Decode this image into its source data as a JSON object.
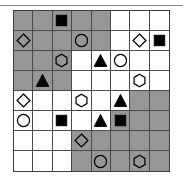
{
  "diagram": {
    "type": "8x8-shape-grid",
    "rows": 8,
    "columns": 8,
    "colors": {
      "shaded_cell": "#969696",
      "empty_cell": "#ffffff",
      "grid_line": "#4a4a4a",
      "border": "#3d3d3d",
      "shape_fill_solid": "#000000",
      "shape_stroke": "#000000",
      "top_rule": "#8f8f8f"
    },
    "legend": {
      "shapes": [
        "square",
        "circle",
        "diamond",
        "hexagon",
        "triangle"
      ],
      "fills": [
        "solid",
        "outline"
      ],
      "backgrounds": [
        "gray",
        "white"
      ]
    },
    "cells": [
      [
        {
          "bg": "gray",
          "shape": "none",
          "fill": "none"
        },
        {
          "bg": "gray",
          "shape": "none",
          "fill": "none"
        },
        {
          "bg": "gray",
          "shape": "square",
          "fill": "solid"
        },
        {
          "bg": "gray",
          "shape": "none",
          "fill": "none"
        },
        {
          "bg": "gray",
          "shape": "none",
          "fill": "none"
        },
        {
          "bg": "white",
          "shape": "none",
          "fill": "none"
        },
        {
          "bg": "white",
          "shape": "none",
          "fill": "none"
        },
        {
          "bg": "white",
          "shape": "none",
          "fill": "none"
        }
      ],
      [
        {
          "bg": "gray",
          "shape": "diamond",
          "fill": "outline"
        },
        {
          "bg": "gray",
          "shape": "none",
          "fill": "none"
        },
        {
          "bg": "gray",
          "shape": "none",
          "fill": "none"
        },
        {
          "bg": "gray",
          "shape": "circle",
          "fill": "outline"
        },
        {
          "bg": "gray",
          "shape": "none",
          "fill": "none"
        },
        {
          "bg": "white",
          "shape": "none",
          "fill": "none"
        },
        {
          "bg": "white",
          "shape": "diamond",
          "fill": "outline"
        },
        {
          "bg": "white",
          "shape": "square",
          "fill": "solid"
        }
      ],
      [
        {
          "bg": "gray",
          "shape": "none",
          "fill": "none"
        },
        {
          "bg": "gray",
          "shape": "none",
          "fill": "none"
        },
        {
          "bg": "gray",
          "shape": "hexagon",
          "fill": "outline"
        },
        {
          "bg": "white",
          "shape": "none",
          "fill": "none"
        },
        {
          "bg": "white",
          "shape": "triangle",
          "fill": "solid"
        },
        {
          "bg": "white",
          "shape": "circle",
          "fill": "outline"
        },
        {
          "bg": "white",
          "shape": "none",
          "fill": "none"
        },
        {
          "bg": "white",
          "shape": "none",
          "fill": "none"
        }
      ],
      [
        {
          "bg": "gray",
          "shape": "none",
          "fill": "none"
        },
        {
          "bg": "gray",
          "shape": "triangle",
          "fill": "solid"
        },
        {
          "bg": "gray",
          "shape": "none",
          "fill": "none"
        },
        {
          "bg": "white",
          "shape": "none",
          "fill": "none"
        },
        {
          "bg": "white",
          "shape": "none",
          "fill": "none"
        },
        {
          "bg": "white",
          "shape": "none",
          "fill": "none"
        },
        {
          "bg": "white",
          "shape": "hexagon",
          "fill": "outline"
        },
        {
          "bg": "white",
          "shape": "none",
          "fill": "none"
        }
      ],
      [
        {
          "bg": "white",
          "shape": "diamond",
          "fill": "outline"
        },
        {
          "bg": "white",
          "shape": "none",
          "fill": "none"
        },
        {
          "bg": "white",
          "shape": "none",
          "fill": "none"
        },
        {
          "bg": "white",
          "shape": "hexagon",
          "fill": "outline"
        },
        {
          "bg": "white",
          "shape": "none",
          "fill": "none"
        },
        {
          "bg": "white",
          "shape": "triangle",
          "fill": "solid"
        },
        {
          "bg": "gray",
          "shape": "none",
          "fill": "none"
        },
        {
          "bg": "gray",
          "shape": "none",
          "fill": "none"
        }
      ],
      [
        {
          "bg": "white",
          "shape": "circle",
          "fill": "outline"
        },
        {
          "bg": "white",
          "shape": "none",
          "fill": "none"
        },
        {
          "bg": "white",
          "shape": "square",
          "fill": "solid"
        },
        {
          "bg": "white",
          "shape": "none",
          "fill": "none"
        },
        {
          "bg": "white",
          "shape": "triangle",
          "fill": "solid"
        },
        {
          "bg": "gray",
          "shape": "square",
          "fill": "solid"
        },
        {
          "bg": "gray",
          "shape": "none",
          "fill": "none"
        },
        {
          "bg": "gray",
          "shape": "none",
          "fill": "none"
        }
      ],
      [
        {
          "bg": "white",
          "shape": "none",
          "fill": "none"
        },
        {
          "bg": "white",
          "shape": "none",
          "fill": "none"
        },
        {
          "bg": "white",
          "shape": "none",
          "fill": "none"
        },
        {
          "bg": "gray",
          "shape": "diamond",
          "fill": "outline"
        },
        {
          "bg": "gray",
          "shape": "none",
          "fill": "none"
        },
        {
          "bg": "gray",
          "shape": "none",
          "fill": "none"
        },
        {
          "bg": "gray",
          "shape": "none",
          "fill": "none"
        },
        {
          "bg": "gray",
          "shape": "none",
          "fill": "none"
        }
      ],
      [
        {
          "bg": "white",
          "shape": "none",
          "fill": "none"
        },
        {
          "bg": "white",
          "shape": "none",
          "fill": "none"
        },
        {
          "bg": "white",
          "shape": "none",
          "fill": "none"
        },
        {
          "bg": "gray",
          "shape": "none",
          "fill": "none"
        },
        {
          "bg": "gray",
          "shape": "circle",
          "fill": "outline"
        },
        {
          "bg": "gray",
          "shape": "none",
          "fill": "none"
        },
        {
          "bg": "gray",
          "shape": "hexagon",
          "fill": "outline"
        },
        {
          "bg": "gray",
          "shape": "none",
          "fill": "none"
        }
      ]
    ]
  }
}
